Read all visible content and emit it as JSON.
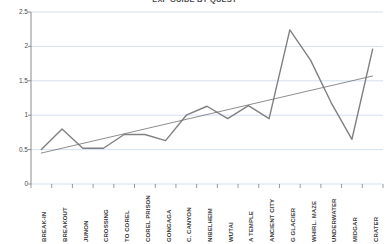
{
  "chart_data": {
    "type": "line",
    "title": "EXP GUIDE BY QUEST",
    "xlabel": "",
    "ylabel": "",
    "ylim": [
      0,
      2.5
    ],
    "yticks": [
      "0",
      "0.5",
      "1",
      "1.5",
      "2",
      "2.5"
    ],
    "grid": true,
    "legend": "none",
    "categories": [
      "BREAK-IN",
      "BREAKOUT",
      "JUNON",
      "CROSSING",
      "TO COREL",
      "COREL PRISON",
      "GONGAGA",
      "C. CANYON",
      "NIBELHEIM",
      "WUTAI",
      "A TEMPLE",
      "ANCIENT CITY",
      "G GLACIER",
      "WHIRL. MAZE",
      "UNDERWATER",
      "MIDGAR",
      "CRATER"
    ],
    "series": [
      {
        "name": "Value",
        "type": "line",
        "color": "#808080",
        "values": [
          0.5,
          0.8,
          0.52,
          0.52,
          0.72,
          0.72,
          0.63,
          1.0,
          1.13,
          0.95,
          1.14,
          0.95,
          2.24,
          1.8,
          1.18,
          0.65,
          1.96
        ]
      },
      {
        "name": "Linear trend",
        "type": "trendline",
        "color": "#707070",
        "values": [
          0.45,
          0.52,
          0.59,
          0.66,
          0.73,
          0.8,
          0.87,
          0.94,
          1.01,
          1.08,
          1.15,
          1.22,
          1.29,
          1.36,
          1.43,
          1.5,
          1.57
        ]
      }
    ],
    "colors": {
      "gridline": "#c8d8ef",
      "axis": "#808080",
      "series": "#808080",
      "trendline": "#707070",
      "text": "#404040",
      "background": "#ffffff"
    }
  }
}
